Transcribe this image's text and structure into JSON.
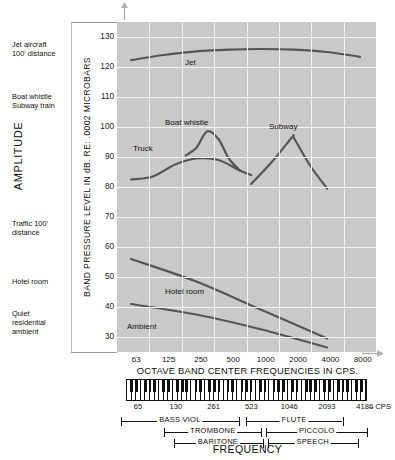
{
  "chart_data": {
    "type": "line",
    "title": "",
    "xlabel": "OCTAVE BAND CENTER FREQUENCIES IN CPS.",
    "ylabel": "BAND PRESSURE LEVEL IN dB. RE: .0002 MICROBARS",
    "bottom_label": "FREQUENCY",
    "amplitude_label": "AMPLITUDE",
    "xlim_labels": [
      "63",
      "125",
      "250",
      "500",
      "1000",
      "2000",
      "4000",
      "8000"
    ],
    "ylim": [
      25,
      135
    ],
    "yticks": [
      130,
      120,
      110,
      100,
      90,
      80,
      70,
      60,
      50,
      40,
      30
    ],
    "xticks": [
      63,
      125,
      250,
      500,
      1000,
      2000,
      4000,
      8000
    ],
    "grid": true,
    "legend_position": "inline-annotations",
    "series": [
      {
        "name": "Jet",
        "label": "Jet",
        "points": [
          [
            63,
            122.3
          ],
          [
            125,
            124.0
          ],
          [
            250,
            125.2
          ],
          [
            500,
            125.8
          ],
          [
            1000,
            126.0
          ],
          [
            2000,
            125.8
          ],
          [
            4000,
            125.0
          ],
          [
            8000,
            123.4
          ]
        ]
      },
      {
        "name": "Truck",
        "label": "Truck",
        "points": [
          [
            63,
            82.5
          ],
          [
            100,
            83.5
          ],
          [
            160,
            87.5
          ],
          [
            250,
            89.5
          ],
          [
            400,
            89.0
          ],
          [
            630,
            85.5
          ],
          [
            800,
            84.0
          ]
        ]
      },
      {
        "name": "Boat whistle",
        "label": "Boat whistle",
        "points": [
          [
            200,
            90.5
          ],
          [
            250,
            93.0
          ],
          [
            315,
            98.5
          ],
          [
            400,
            96.0
          ],
          [
            500,
            89.5
          ],
          [
            630,
            85.5
          ]
        ]
      },
      {
        "name": "Subway",
        "label": "Subway",
        "points": [
          [
            800,
            81.0
          ],
          [
            1250,
            88.5
          ],
          [
            1900,
            96.5
          ],
          [
            2000,
            96.0
          ],
          [
            2800,
            87.0
          ],
          [
            4000,
            79.5
          ]
        ]
      },
      {
        "name": "Hotel room",
        "label": "Hotel room",
        "points": [
          [
            63,
            56.0
          ],
          [
            250,
            48.5
          ],
          [
            1000,
            39.0
          ],
          [
            4000,
            29.5
          ]
        ]
      },
      {
        "name": "Ambient",
        "label": "Ambient",
        "points": [
          [
            63,
            41.0
          ],
          [
            250,
            37.5
          ],
          [
            1000,
            32.5
          ],
          [
            4000,
            26.5
          ]
        ]
      }
    ],
    "amplitude_annotations": [
      {
        "lines": [
          "Jet aircraft",
          "100' distance"
        ],
        "top": 40
      },
      {
        "lines": [
          "Boat whistle",
          "Subway train"
        ],
        "top": 92
      },
      {
        "lines": [
          "Traffic 100'",
          "distance"
        ],
        "top": 219
      },
      {
        "lines": [
          "Hotel room"
        ],
        "top": 277
      },
      {
        "lines": [
          "Quiet",
          "residential",
          "ambient"
        ],
        "top": 309
      }
    ],
    "keyboard": {
      "ticks": [
        "65",
        "130",
        "261",
        "523",
        "1046",
        "2093",
        "4186"
      ],
      "unit": "– CPS"
    },
    "instrument_ranges": [
      {
        "name": "BASS VIOL",
        "row": 0,
        "start": 0.01,
        "end": 0.47
      },
      {
        "name": "FLUTE",
        "row": 0,
        "start": 0.495,
        "end": 0.87
      },
      {
        "name": "TROMBONE",
        "row": 1,
        "start": 0.18,
        "end": 0.555
      },
      {
        "name": "PICCOLO",
        "row": 1,
        "start": 0.575,
        "end": 0.965
      },
      {
        "name": "BARITONE",
        "row": 2,
        "start": 0.215,
        "end": 0.56
      },
      {
        "name": "SPEECH",
        "row": 2,
        "start": 0.58,
        "end": 0.93
      }
    ],
    "colors": {
      "plot_background": "#c9c9c9",
      "gridline": "#f2f2f2",
      "curve": "#555555",
      "text": "#111111"
    }
  }
}
